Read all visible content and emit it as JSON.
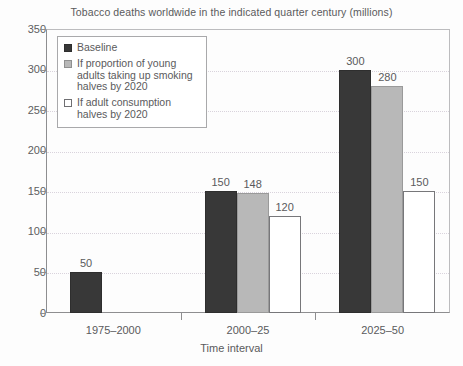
{
  "chart_data": {
    "type": "bar",
    "title": "Tobacco deaths worldwide in the indicated quarter century (millions)",
    "xlabel": "Time interval",
    "ylabel": "",
    "categories": [
      "1975–2000",
      "2000–25",
      "2025–50"
    ],
    "series": [
      {
        "name": "Baseline",
        "values": [
          50,
          150,
          300
        ],
        "color": "#383838"
      },
      {
        "name": "If proportion of young adults taking up smoking halves by 2020",
        "values": [
          null,
          148,
          280
        ],
        "color": "#b8b8b8"
      },
      {
        "name": "If adult consumption halves by 2020",
        "values": [
          null,
          120,
          150
        ],
        "color": "#ffffff"
      }
    ],
    "ylim": [
      0,
      350
    ],
    "ytick_values": [
      0,
      50,
      100,
      150,
      200,
      250,
      300,
      350
    ],
    "ytick_labels": [
      "0",
      "50",
      "100",
      "150",
      "200",
      "250",
      "300",
      "350"
    ],
    "grid": true,
    "grid_axis": "y",
    "legend_position": "upper left",
    "data_labels": [
      {
        "text": "50",
        "series": 0,
        "category": 0
      },
      {
        "text": "150",
        "series": 0,
        "category": 1
      },
      {
        "text": "148",
        "series": 1,
        "category": 1
      },
      {
        "text": "120",
        "series": 2,
        "category": 1
      },
      {
        "text": "300",
        "series": 0,
        "category": 2
      },
      {
        "text": "280",
        "series": 1,
        "category": 2
      },
      {
        "text": "150",
        "series": 2,
        "category": 2
      }
    ]
  },
  "legend": {
    "entries": [
      {
        "label": "Baseline"
      },
      {
        "label": "If proportion of young adults taking up smoking halves by 2020"
      },
      {
        "label": "If adult consumption halves by 2020"
      }
    ]
  }
}
